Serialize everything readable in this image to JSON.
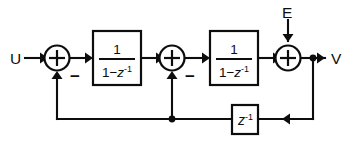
{
  "diagram": {
    "background_color": "#ffffff",
    "line_color": "#0d0d0d",
    "signals": {
      "input_label": "U",
      "noise_label": "E",
      "output_label": "V"
    },
    "blocks": [
      {
        "id": "integrator-1",
        "numerator": "1",
        "denominator_prefix": "1−",
        "denominator_var": "z",
        "denominator_exponent": "-1"
      },
      {
        "id": "integrator-2",
        "numerator": "1",
        "denominator_prefix": "1−",
        "denominator_var": "z",
        "denominator_exponent": "-1"
      }
    ],
    "delay_block": {
      "id": "delay",
      "var": "z",
      "exponent": "-1"
    },
    "summing_nodes": [
      {
        "id": "sum-1",
        "operator": "+",
        "feedback_sign": "−"
      },
      {
        "id": "sum-2",
        "operator": "+",
        "feedback_sign": "−"
      },
      {
        "id": "sum-3",
        "operator": "+",
        "feedback_sign": ""
      }
    ]
  }
}
